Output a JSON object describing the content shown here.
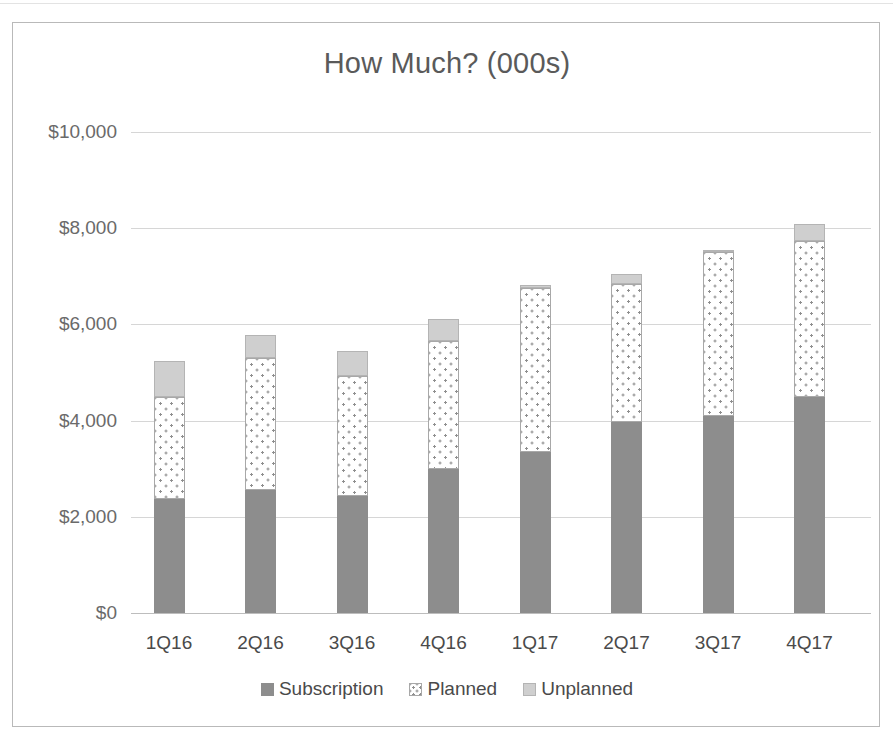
{
  "chart_data": {
    "type": "bar",
    "subtype": "stacked-column",
    "title": "How Much? (000s)",
    "xlabel": "",
    "ylabel": "",
    "grid": true,
    "legend_position": "bottom",
    "ylim": [
      0,
      10000
    ],
    "categories": [
      "1Q16",
      "2Q16",
      "3Q16",
      "4Q16",
      "1Q17",
      "2Q17",
      "3Q17",
      "4Q17"
    ],
    "ytick_labels": [
      "$0",
      "$2,000",
      "$4,000",
      "$6,000",
      "$8,000",
      "$10,000"
    ],
    "ytick_values": [
      0,
      2000,
      4000,
      6000,
      8000,
      10000
    ],
    "series": [
      {
        "name": "Subscription",
        "color": "#8d8d8d",
        "fill": "solid",
        "values": [
          2370,
          2560,
          2430,
          2990,
          3350,
          3980,
          4100,
          4500
        ]
      },
      {
        "name": "Planned",
        "color": "#ffffff",
        "fill": "dotted",
        "values": [
          2130,
          2750,
          2500,
          2660,
          3400,
          2850,
          3400,
          3240
        ]
      },
      {
        "name": "Unplanned",
        "color": "#cfcfcf",
        "fill": "solid",
        "values": [
          740,
          460,
          510,
          460,
          60,
          220,
          30,
          340
        ]
      }
    ],
    "totals": [
      5240,
      5770,
      5440,
      6110,
      6810,
      7050,
      7530,
      8080
    ]
  },
  "legend": {
    "items": [
      {
        "label": "Subscription",
        "swatch": "legend-swatch-subscription"
      },
      {
        "label": "Planned",
        "swatch": "legend-swatch-planned"
      },
      {
        "label": "Unplanned",
        "swatch": "legend-swatch-unplanned"
      }
    ]
  }
}
